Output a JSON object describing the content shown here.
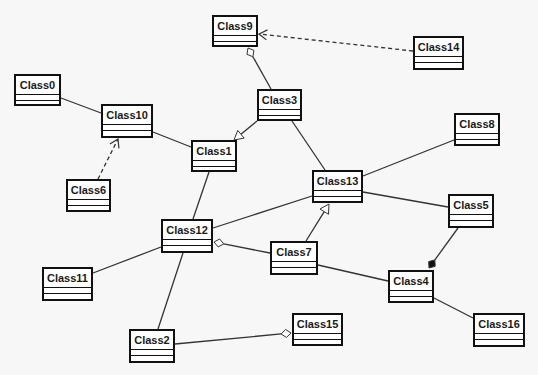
{
  "diagram": {
    "type": "uml-class-diagram",
    "background": "#f7f7f7",
    "line_color": "#333333",
    "classes": [
      {
        "id": "Class9",
        "label": "Class9",
        "x": 212,
        "y": 15,
        "w": 46,
        "h": 32
      },
      {
        "id": "Class14",
        "label": "Class14",
        "x": 413,
        "y": 36,
        "w": 51,
        "h": 34
      },
      {
        "id": "Class0",
        "label": "Class0",
        "x": 14,
        "y": 74,
        "w": 47,
        "h": 32
      },
      {
        "id": "Class3",
        "label": "Class3",
        "x": 257,
        "y": 89,
        "w": 45,
        "h": 32
      },
      {
        "id": "Class10",
        "label": "Class10",
        "x": 101,
        "y": 104,
        "w": 52,
        "h": 34
      },
      {
        "id": "Class8",
        "label": "Class8",
        "x": 454,
        "y": 113,
        "w": 46,
        "h": 33
      },
      {
        "id": "Class1",
        "label": "Class1",
        "x": 191,
        "y": 140,
        "w": 46,
        "h": 32
      },
      {
        "id": "Class6",
        "label": "Class6",
        "x": 66,
        "y": 179,
        "w": 45,
        "h": 33
      },
      {
        "id": "Class13",
        "label": "Class13",
        "x": 312,
        "y": 170,
        "w": 51,
        "h": 33
      },
      {
        "id": "Class5",
        "label": "Class5",
        "x": 448,
        "y": 194,
        "w": 46,
        "h": 34
      },
      {
        "id": "Class12",
        "label": "Class12",
        "x": 161,
        "y": 219,
        "w": 52,
        "h": 34
      },
      {
        "id": "Class7",
        "label": "Class7",
        "x": 270,
        "y": 241,
        "w": 48,
        "h": 34
      },
      {
        "id": "Class11",
        "label": "Class11",
        "x": 42,
        "y": 267,
        "w": 51,
        "h": 34
      },
      {
        "id": "Class4",
        "label": "Class4",
        "x": 388,
        "y": 270,
        "w": 46,
        "h": 33
      },
      {
        "id": "Class16",
        "label": "Class16",
        "x": 473,
        "y": 313,
        "w": 52,
        "h": 34
      },
      {
        "id": "Class15",
        "label": "Class15",
        "x": 292,
        "y": 313,
        "w": 51,
        "h": 33
      },
      {
        "id": "Class2",
        "label": "Class2",
        "x": 129,
        "y": 329,
        "w": 46,
        "h": 34
      }
    ],
    "relationships": [
      {
        "from": "Class14",
        "to": "Class9",
        "kind": "dependency",
        "x1": 413,
        "y1": 51,
        "x2": 259,
        "y2": 34
      },
      {
        "from": "Class3",
        "to": "Class9",
        "kind": "aggregation",
        "x1": 271,
        "y1": 89,
        "x2": 248,
        "y2": 48
      },
      {
        "from": "Class3",
        "to": "Class1",
        "kind": "generalization",
        "x1": 257,
        "y1": 121,
        "x2": 234,
        "y2": 140
      },
      {
        "from": "Class3",
        "to": "Class13",
        "kind": "association",
        "x1": 292,
        "y1": 121,
        "x2": 325,
        "y2": 170
      },
      {
        "from": "Class0",
        "to": "Class10",
        "kind": "association",
        "x1": 61,
        "y1": 98,
        "x2": 101,
        "y2": 113
      },
      {
        "from": "Class10",
        "to": "Class1",
        "kind": "association",
        "x1": 153,
        "y1": 132,
        "x2": 191,
        "y2": 147
      },
      {
        "from": "Class6",
        "to": "Class10",
        "kind": "dependency",
        "x1": 98,
        "y1": 179,
        "x2": 118,
        "y2": 139
      },
      {
        "from": "Class1",
        "to": "Class12",
        "kind": "association",
        "x1": 209,
        "y1": 172,
        "x2": 193,
        "y2": 219
      },
      {
        "from": "Class13",
        "to": "Class8",
        "kind": "association",
        "x1": 363,
        "y1": 176,
        "x2": 454,
        "y2": 140
      },
      {
        "from": "Class13",
        "to": "Class5",
        "kind": "association",
        "x1": 363,
        "y1": 192,
        "x2": 448,
        "y2": 207
      },
      {
        "from": "Class12",
        "to": "Class13",
        "kind": "association",
        "x1": 213,
        "y1": 228,
        "x2": 312,
        "y2": 196
      },
      {
        "from": "Class7",
        "to": "Class13",
        "kind": "generalization",
        "x1": 306,
        "y1": 241,
        "x2": 329,
        "y2": 204
      },
      {
        "from": "Class7",
        "to": "Class12",
        "kind": "aggregation",
        "x1": 270,
        "y1": 253,
        "x2": 214,
        "y2": 242
      },
      {
        "from": "Class12",
        "to": "Class11",
        "kind": "association",
        "x1": 161,
        "y1": 247,
        "x2": 93,
        "y2": 273
      },
      {
        "from": "Class12",
        "to": "Class2",
        "kind": "association",
        "x1": 183,
        "y1": 253,
        "x2": 158,
        "y2": 329
      },
      {
        "from": "Class7",
        "to": "Class4",
        "kind": "association",
        "x1": 318,
        "y1": 265,
        "x2": 388,
        "y2": 281
      },
      {
        "from": "Class5",
        "to": "Class4",
        "kind": "composition",
        "x1": 458,
        "y1": 228,
        "x2": 429,
        "y2": 268
      },
      {
        "from": "Class4",
        "to": "Class16",
        "kind": "association",
        "x1": 434,
        "y1": 298,
        "x2": 473,
        "y2": 318
      },
      {
        "from": "Class2",
        "to": "Class15",
        "kind": "aggregation",
        "x1": 175,
        "y1": 344,
        "x2": 291,
        "y2": 333
      }
    ]
  }
}
